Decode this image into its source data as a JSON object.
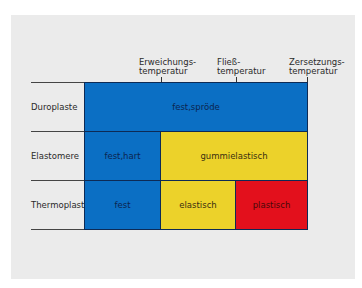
{
  "diagram": {
    "column_markers": [
      {
        "label": "Erweichungs-\ntemperatur"
      },
      {
        "label": "Fließ-\ntemperatur"
      },
      {
        "label": "Zersetzungs-\ntemperatur"
      }
    ],
    "rows": [
      {
        "label": "Duroplaste",
        "cells": [
          {
            "label": "fest,spröde",
            "color": "#0b6fc4"
          }
        ]
      },
      {
        "label": "Elastomere",
        "cells": [
          {
            "label": "fest,hart",
            "color": "#0b6fc4"
          },
          {
            "label": "gummielastisch",
            "color": "#ecd22a"
          }
        ]
      },
      {
        "label": "Thermoplaste",
        "cells": [
          {
            "label": "fest",
            "color": "#0b6fc4"
          },
          {
            "label": "elastisch",
            "color": "#ecd22a"
          },
          {
            "label": "plastisch",
            "color": "#e3101c"
          }
        ]
      }
    ],
    "colors": {
      "blue": "#0b6fc4",
      "yellow": "#ecd22a",
      "red": "#e3101c",
      "panel": "#ebebeb"
    }
  }
}
